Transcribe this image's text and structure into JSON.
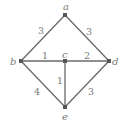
{
  "chart_data": {
    "type": "graph",
    "nodes": [
      {
        "id": "a",
        "label": "a",
        "x": 65,
        "y": 15,
        "lx": 63,
        "ly": 10
      },
      {
        "id": "b",
        "label": "b",
        "x": 21,
        "y": 61,
        "lx": 10,
        "ly": 65
      },
      {
        "id": "c",
        "label": "c",
        "x": 65,
        "y": 61,
        "lx": 62,
        "ly": 58
      },
      {
        "id": "d",
        "label": "d",
        "x": 109,
        "y": 61,
        "lx": 112,
        "ly": 65
      },
      {
        "id": "e",
        "label": "e",
        "x": 65,
        "y": 107,
        "lx": 62,
        "ly": 120
      }
    ],
    "edges": [
      {
        "from": "a",
        "to": "b",
        "weight": "3",
        "wx": 38,
        "wy": 34
      },
      {
        "from": "a",
        "to": "d",
        "weight": "3",
        "wx": 86,
        "wy": 35
      },
      {
        "from": "b",
        "to": "c",
        "weight": "1",
        "wx": 42,
        "wy": 59
      },
      {
        "from": "c",
        "to": "d",
        "weight": "2",
        "wx": 84,
        "wy": 59
      },
      {
        "from": "c",
        "to": "e",
        "weight": "1",
        "wx": 57,
        "wy": 84
      },
      {
        "from": "b",
        "to": "e",
        "weight": "4",
        "wx": 34,
        "wy": 95
      },
      {
        "from": "d",
        "to": "e",
        "weight": "3",
        "wx": 88,
        "wy": 95
      }
    ]
  }
}
